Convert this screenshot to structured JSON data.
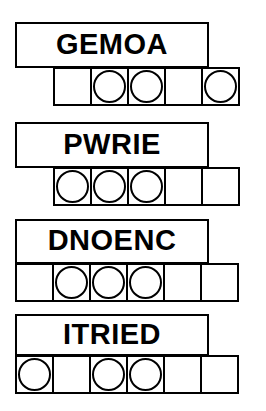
{
  "worksheet": {
    "title": "Scrambled word puzzle worksheet",
    "row_count": 4,
    "rows": [
      {
        "id": "row-1",
        "word": "GEMOA",
        "word_box": {
          "left": 15,
          "top": 22,
          "width": 194,
          "height": 46
        },
        "strip": {
          "left": 53,
          "top": 67,
          "cell_size": 39,
          "cell_count": 5
        },
        "cells": [
          {
            "index": 1,
            "circled": false,
            "letter": ""
          },
          {
            "index": 2,
            "circled": true,
            "letter": ""
          },
          {
            "index": 3,
            "circled": true,
            "letter": ""
          },
          {
            "index": 4,
            "circled": false,
            "letter": ""
          },
          {
            "index": 5,
            "circled": true,
            "letter": ""
          }
        ]
      },
      {
        "id": "row-2",
        "word": "PWRIE",
        "word_box": {
          "left": 15,
          "top": 122,
          "width": 194,
          "height": 46
        },
        "strip": {
          "left": 53,
          "top": 167,
          "cell_size": 39,
          "cell_count": 5
        },
        "cells": [
          {
            "index": 1,
            "circled": true,
            "letter": ""
          },
          {
            "index": 2,
            "circled": true,
            "letter": ""
          },
          {
            "index": 3,
            "circled": true,
            "letter": ""
          },
          {
            "index": 4,
            "circled": false,
            "letter": ""
          },
          {
            "index": 5,
            "circled": false,
            "letter": ""
          }
        ]
      },
      {
        "id": "row-3",
        "word": "DNOENC",
        "word_box": {
          "left": 15,
          "top": 219,
          "width": 194,
          "height": 45
        },
        "strip": {
          "left": 15,
          "top": 263,
          "cell_size": 39,
          "cell_count": 6
        },
        "cells": [
          {
            "index": 1,
            "circled": false,
            "letter": ""
          },
          {
            "index": 2,
            "circled": true,
            "letter": ""
          },
          {
            "index": 3,
            "circled": true,
            "letter": ""
          },
          {
            "index": 4,
            "circled": true,
            "letter": ""
          },
          {
            "index": 5,
            "circled": false,
            "letter": ""
          },
          {
            "index": 6,
            "circled": false,
            "letter": ""
          }
        ]
      },
      {
        "id": "row-4",
        "word": "ITRIED",
        "word_box": {
          "left": 15,
          "top": 314,
          "width": 194,
          "height": 42
        },
        "strip": {
          "left": 15,
          "top": 355,
          "cell_size": 39,
          "cell_count": 6
        },
        "cells": [
          {
            "index": 1,
            "circled": true,
            "letter": ""
          },
          {
            "index": 2,
            "circled": false,
            "letter": ""
          },
          {
            "index": 3,
            "circled": true,
            "letter": ""
          },
          {
            "index": 4,
            "circled": true,
            "letter": ""
          },
          {
            "index": 5,
            "circled": false,
            "letter": ""
          },
          {
            "index": 6,
            "circled": false,
            "letter": ""
          }
        ]
      }
    ]
  },
  "colors": {
    "ink": "#000000",
    "paper": "#ffffff"
  }
}
